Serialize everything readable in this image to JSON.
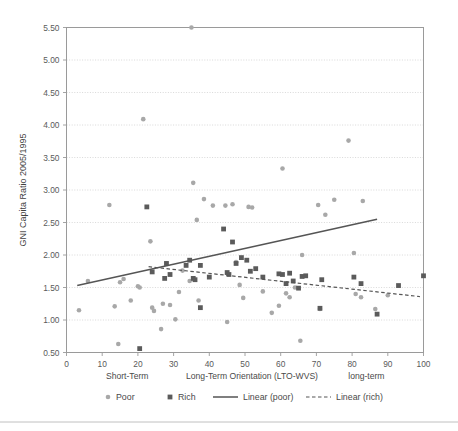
{
  "chart_data": {
    "type": "scatter",
    "title": "",
    "xlabel": "Long-Term Orientation (LTO-WVS)",
    "ylabel": "GNI Capita Ratio 2005/1995",
    "xlim": [
      0,
      100
    ],
    "ylim": [
      0.5,
      5.5
    ],
    "grid": true,
    "legend_position": "bottom",
    "x_ticks": [
      "0",
      "10",
      "20",
      "30",
      "40",
      "50",
      "60",
      "70",
      "80",
      "90",
      "100"
    ],
    "x_tick_values": [
      0,
      10,
      20,
      30,
      40,
      50,
      60,
      70,
      80,
      90,
      100
    ],
    "y_ticks": [
      "0.50",
      "1.00",
      "1.50",
      "2.00",
      "2.50",
      "3.00",
      "3.50",
      "4.00",
      "4.50",
      "5.00",
      "5.50"
    ],
    "y_tick_values": [
      0.5,
      1.0,
      1.5,
      2.0,
      2.5,
      3.0,
      3.5,
      4.0,
      4.5,
      5.0,
      5.5
    ],
    "axis_annotations": [
      {
        "label": "Short-Term",
        "x": 17
      },
      {
        "label": "long-term",
        "x": 84
      }
    ],
    "series": [
      {
        "name": "Poor",
        "marker": "circle",
        "color": "#a8a8a8",
        "points": [
          [
            3.5,
            1.15
          ],
          [
            6.0,
            1.6
          ],
          [
            12.0,
            2.77
          ],
          [
            13.5,
            1.21
          ],
          [
            14.5,
            0.63
          ],
          [
            15.0,
            1.58
          ],
          [
            16.0,
            1.63
          ],
          [
            18.0,
            1.3
          ],
          [
            20.0,
            1.52
          ],
          [
            20.5,
            1.5
          ],
          [
            21.5,
            4.09
          ],
          [
            23.5,
            2.21
          ],
          [
            24.0,
            1.19
          ],
          [
            24.5,
            1.14
          ],
          [
            26.5,
            0.86
          ],
          [
            27.0,
            1.25
          ],
          [
            29.0,
            1.23
          ],
          [
            30.5,
            1.01
          ],
          [
            31.5,
            1.43
          ],
          [
            32.5,
            1.76
          ],
          [
            34.5,
            1.6
          ],
          [
            35.0,
            5.5
          ],
          [
            35.5,
            3.11
          ],
          [
            36.5,
            2.54
          ],
          [
            37.0,
            1.3
          ],
          [
            38.5,
            2.86
          ],
          [
            41.0,
            2.76
          ],
          [
            44.5,
            2.76
          ],
          [
            45.0,
            0.97
          ],
          [
            46.5,
            2.78
          ],
          [
            47.5,
            1.89
          ],
          [
            48.5,
            1.54
          ],
          [
            49.5,
            1.34
          ],
          [
            51.0,
            2.74
          ],
          [
            52.0,
            2.73
          ],
          [
            55.0,
            1.44
          ],
          [
            57.5,
            1.11
          ],
          [
            59.5,
            1.22
          ],
          [
            60.5,
            3.33
          ],
          [
            61.5,
            1.41
          ],
          [
            62.5,
            1.35
          ],
          [
            64.0,
            1.5
          ],
          [
            65.5,
            0.68
          ],
          [
            66.0,
            2.0
          ],
          [
            70.5,
            2.77
          ],
          [
            71.0,
            1.17
          ],
          [
            72.5,
            2.62
          ],
          [
            75.0,
            2.85
          ],
          [
            79.0,
            3.76
          ],
          [
            80.5,
            2.03
          ],
          [
            81.0,
            1.4
          ],
          [
            82.5,
            1.35
          ],
          [
            83.0,
            2.83
          ],
          [
            86.5,
            1.17
          ],
          [
            90.0,
            1.38
          ]
        ]
      },
      {
        "name": "Rich",
        "marker": "square",
        "color": "#5b5b5b",
        "points": [
          [
            20.5,
            0.56
          ],
          [
            22.5,
            2.74
          ],
          [
            24.0,
            1.74
          ],
          [
            27.5,
            1.64
          ],
          [
            28.0,
            1.87
          ],
          [
            29.0,
            1.7
          ],
          [
            33.5,
            1.84
          ],
          [
            34.5,
            1.92
          ],
          [
            35.5,
            1.64
          ],
          [
            36.0,
            1.62
          ],
          [
            37.5,
            1.19
          ],
          [
            37.5,
            1.84
          ],
          [
            40.0,
            1.66
          ],
          [
            44.0,
            2.4
          ],
          [
            45.0,
            1.73
          ],
          [
            45.5,
            1.7
          ],
          [
            46.5,
            2.2
          ],
          [
            47.5,
            1.87
          ],
          [
            49.0,
            1.96
          ],
          [
            50.5,
            1.92
          ],
          [
            51.5,
            1.75
          ],
          [
            53.0,
            1.79
          ],
          [
            55.0,
            1.66
          ],
          [
            59.5,
            1.71
          ],
          [
            60.5,
            1.7
          ],
          [
            61.5,
            1.56
          ],
          [
            62.5,
            1.72
          ],
          [
            63.5,
            1.6
          ],
          [
            65.0,
            1.49
          ],
          [
            66.0,
            1.67
          ],
          [
            67.0,
            1.68
          ],
          [
            71.0,
            1.18
          ],
          [
            71.5,
            1.62
          ],
          [
            80.5,
            1.66
          ],
          [
            82.5,
            1.56
          ],
          [
            87.0,
            1.09
          ],
          [
            93.0,
            1.53
          ],
          [
            100.0,
            1.68
          ]
        ]
      }
    ],
    "trendlines": [
      {
        "name": "Linear (poor)",
        "style": "solid",
        "color": "#555555",
        "x0": 3.0,
        "y0": 1.53,
        "x1": 87.0,
        "y1": 2.55
      },
      {
        "name": "Linear (rich)",
        "style": "dashed",
        "color": "#555555",
        "x0": 23.0,
        "y0": 1.82,
        "x1": 99.0,
        "y1": 1.36
      }
    ],
    "legend": [
      {
        "label": "Poor",
        "marker": "circle",
        "color": "#a8a8a8"
      },
      {
        "label": "Rich",
        "marker": "square",
        "color": "#5b5b5b"
      },
      {
        "label": "Linear (poor)",
        "marker": "solid-line",
        "color": "#555555"
      },
      {
        "label": "Linear (rich)",
        "marker": "dashed-line",
        "color": "#555555"
      }
    ]
  }
}
